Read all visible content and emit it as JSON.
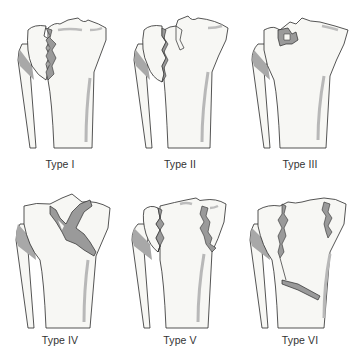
{
  "figure": {
    "colors": {
      "bone_fill": "#f7f7f4",
      "outline": "#2a2a2a",
      "fracture_fill": "#9a9a9a",
      "shadow": "#a8a8a8",
      "label_text": "#333333"
    },
    "panels": [
      {
        "id": "type-1",
        "label": "Type I"
      },
      {
        "id": "type-2",
        "label": "Type II"
      },
      {
        "id": "type-3",
        "label": "Type III"
      },
      {
        "id": "type-4",
        "label": "Type IV"
      },
      {
        "id": "type-5",
        "label": "Type V"
      },
      {
        "id": "type-6",
        "label": "Type VI"
      }
    ]
  }
}
